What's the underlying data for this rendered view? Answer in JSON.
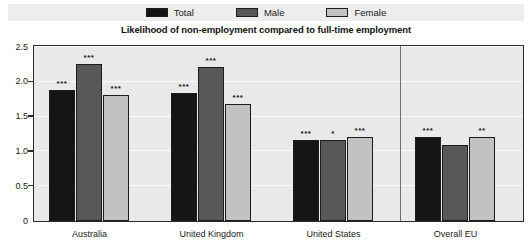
{
  "legend": {
    "entries": [
      {
        "label": "Total",
        "color": "#151515",
        "key": "total"
      },
      {
        "label": "Male",
        "color": "#585858",
        "key": "male"
      },
      {
        "label": "Female",
        "color": "#c2c2c2",
        "key": "female"
      }
    ]
  },
  "chart_data": {
    "type": "bar",
    "title": "Likelihood of non-employment compared to full-time employment",
    "xlabel": "",
    "ylabel": "",
    "ylim": [
      0,
      2.5
    ],
    "yticks": [
      0,
      0.5,
      1.0,
      1.5,
      2.0,
      2.5
    ],
    "ytick_labels": [
      "0",
      "0.5",
      "1.0",
      "1.5",
      "2.0",
      "2.5"
    ],
    "grid": true,
    "legend_position": "top",
    "categories": [
      "Australia",
      "United Kingdom",
      "United States",
      "Overall EU"
    ],
    "series": [
      {
        "name": "Total",
        "color": "#151515",
        "values": [
          1.88,
          1.84,
          1.17,
          1.21
        ],
        "significance": [
          "***",
          "***",
          "***",
          "***"
        ]
      },
      {
        "name": "Male",
        "color": "#585858",
        "values": [
          2.26,
          2.21,
          1.17,
          1.09
        ],
        "significance": [
          "***",
          "***",
          "*",
          ""
        ]
      },
      {
        "name": "Female",
        "color": "#c2c2c2",
        "values": [
          1.81,
          1.68,
          1.2,
          1.21
        ],
        "significance": [
          "***",
          "***",
          "***",
          "**"
        ]
      }
    ],
    "separator_after_category": "United States"
  }
}
